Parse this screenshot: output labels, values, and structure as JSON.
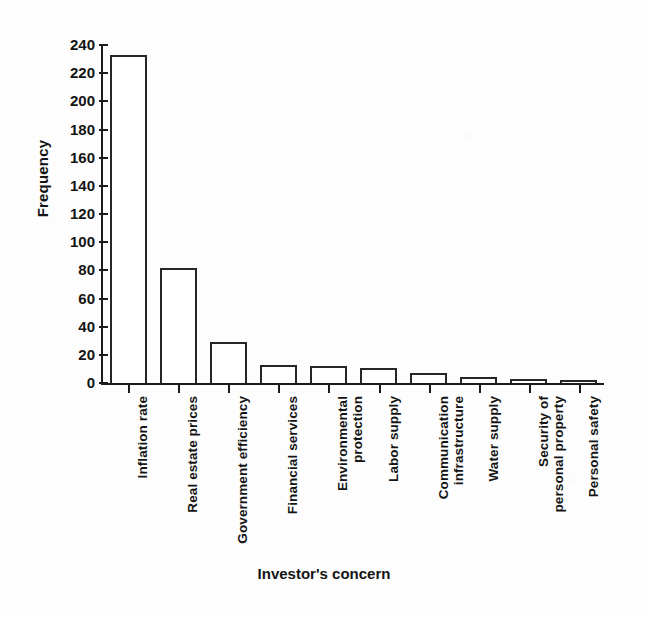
{
  "chart_data": {
    "type": "bar",
    "title": "",
    "xlabel": "Investor's concern",
    "ylabel": "Frequency",
    "categories": [
      "Inflation rate",
      "Real estate prices",
      "Government efficiency",
      "Financial services",
      "Environmental\nprotection",
      "Labor supply",
      "Communication\ninfrastructure",
      "Water supply",
      "Security of\npersonal property",
      "Personal safety"
    ],
    "values": [
      233,
      82,
      29,
      13,
      12,
      11,
      7,
      4,
      3,
      2
    ],
    "ylim": [
      0,
      240
    ],
    "ytick_labels": [
      "240",
      "220",
      "200",
      "180",
      "160",
      "140",
      "120",
      "100",
      "80",
      "60",
      "40",
      "20",
      "0"
    ],
    "ytick_values": [
      240,
      220,
      200,
      180,
      160,
      140,
      120,
      100,
      80,
      60,
      40,
      20,
      0
    ],
    "ytick_step": 20,
    "grid": false,
    "legend": false,
    "bar_fill": "#ffffff",
    "bar_edge": "#262626",
    "axis_color": "#1b1b1b",
    "background": "#fdfdfd"
  }
}
